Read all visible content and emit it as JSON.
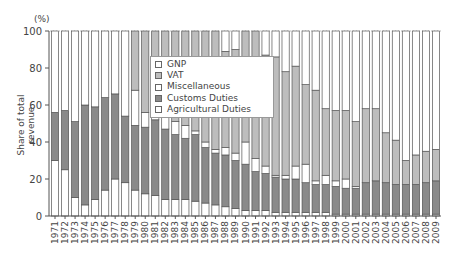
{
  "chart_data": {
    "type": "bar",
    "stacked": true,
    "title": "",
    "xlabel": "",
    "ylabel": "Share of total revenue",
    "y_unit": "(%)",
    "ylim": [
      0,
      100
    ],
    "yticks": [
      0,
      20,
      40,
      60,
      80,
      100
    ],
    "grid": false,
    "legend_position": "upper-center inside",
    "categories": [
      "1971",
      "1972",
      "1973",
      "1974",
      "1975",
      "1976",
      "1977",
      "1978",
      "1979",
      "1980",
      "1981",
      "1982",
      "1983",
      "1984",
      "1985",
      "1986",
      "1987",
      "1988",
      "1989",
      "1990",
      "1991",
      "1992",
      "1993",
      "1994",
      "1995",
      "1996",
      "1997",
      "1998",
      "1999",
      "2000",
      "2001",
      "2002",
      "2003",
      "2004",
      "2005",
      "2006",
      "2007",
      "2008",
      "2009"
    ],
    "series": [
      {
        "name": "Agricultural Duties",
        "color": "#ffffff",
        "values": [
          30,
          25,
          10,
          6,
          9,
          14,
          20,
          18,
          14,
          12,
          11,
          9,
          9,
          9,
          8,
          7,
          6,
          5,
          4,
          3,
          3,
          3,
          2,
          2,
          2,
          2,
          2,
          2,
          1,
          1,
          1,
          1,
          1,
          1,
          1,
          1,
          1,
          1,
          1
        ]
      },
      {
        "name": "Customs Duties",
        "color": "#8a8a8a",
        "values": [
          26,
          32,
          41,
          54,
          50,
          50,
          46,
          36,
          35,
          36,
          41,
          38,
          35,
          33,
          36,
          30,
          28,
          28,
          26,
          25,
          21,
          20,
          19,
          18,
          18,
          16,
          15,
          15,
          15,
          14,
          14,
          17,
          18,
          17,
          16,
          16,
          16,
          17,
          18
        ]
      },
      {
        "name": "Miscellaneous",
        "color": "#ffffff",
        "values": [
          0,
          0,
          0,
          0,
          0,
          0,
          0,
          0,
          19,
          8,
          6,
          8,
          7,
          7,
          2,
          3,
          2,
          4,
          4,
          12,
          7,
          4,
          1,
          2,
          7,
          10,
          2,
          5,
          3,
          5,
          1,
          0,
          0,
          0,
          0,
          0,
          0,
          0,
          0
        ]
      },
      {
        "name": "VAT",
        "color": "#bdbdbd",
        "values": [
          0,
          0,
          0,
          0,
          0,
          0,
          0,
          0,
          32,
          44,
          42,
          45,
          49,
          51,
          54,
          60,
          64,
          52,
          56,
          60,
          69,
          60,
          64,
          56,
          54,
          43,
          49,
          36,
          38,
          37,
          35,
          40,
          39,
          27,
          24,
          13,
          16,
          17,
          17
        ]
      },
      {
        "name": "GNP",
        "color": "#ffffff",
        "values": [
          44,
          43,
          49,
          40,
          41,
          36,
          34,
          46,
          0,
          0,
          0,
          0,
          0,
          0,
          0,
          0,
          0,
          11,
          10,
          0,
          0,
          13,
          14,
          22,
          19,
          29,
          32,
          42,
          43,
          43,
          49,
          42,
          42,
          55,
          59,
          70,
          67,
          65,
          64
        ]
      }
    ],
    "legend": [
      "GNP",
      "VAT",
      "Miscellaneous",
      "Customs Duties",
      "Agricultural Duties"
    ]
  },
  "legend_items": [
    {
      "label": "GNP",
      "color": "#ffffff"
    },
    {
      "label": "VAT",
      "color": "#bdbdbd"
    },
    {
      "label": "Miscellaneous",
      "color": "#ffffff"
    },
    {
      "label": "Customs Duties",
      "color": "#8a8a8a"
    },
    {
      "label": "Agricultural Duties",
      "color": "#ffffff"
    }
  ],
  "axis": {
    "ylabel": "Share of total revenue",
    "unit": "(%)"
  }
}
